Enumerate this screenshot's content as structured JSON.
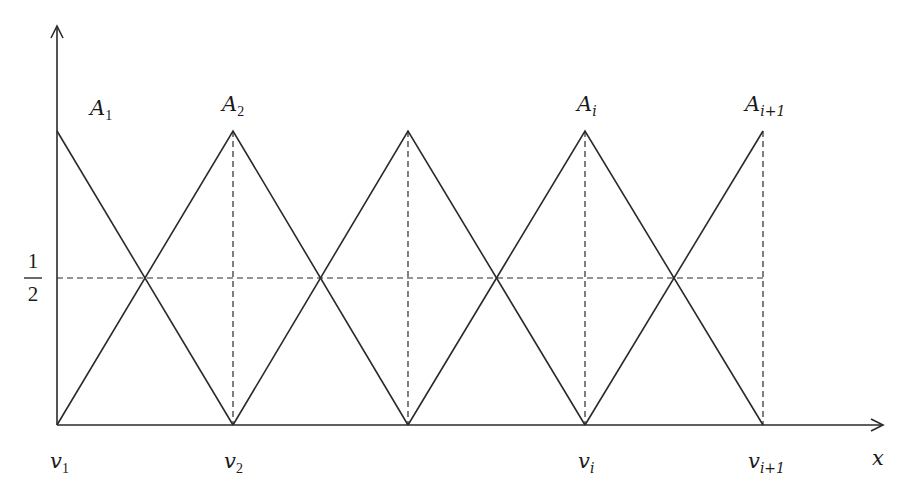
{
  "diagram": {
    "type": "triangular-membership-functions",
    "axes": {
      "x_label": "x",
      "y_tick_label": {
        "numerator": "1",
        "denominator": "2"
      }
    },
    "functions": [
      {
        "name": "A",
        "sub": "1"
      },
      {
        "name": "A",
        "sub": "2"
      },
      {
        "name": "A",
        "sub": "i"
      },
      {
        "name": "A",
        "sub": "i+1"
      }
    ],
    "nodes": [
      {
        "name": "v",
        "sub": "1"
      },
      {
        "name": "v",
        "sub": "2"
      },
      {
        "name": "v",
        "sub": "i"
      },
      {
        "name": "v",
        "sub": "i+1"
      }
    ],
    "colors": {
      "line": "#2a2a2a",
      "background": "#ffffff"
    }
  }
}
